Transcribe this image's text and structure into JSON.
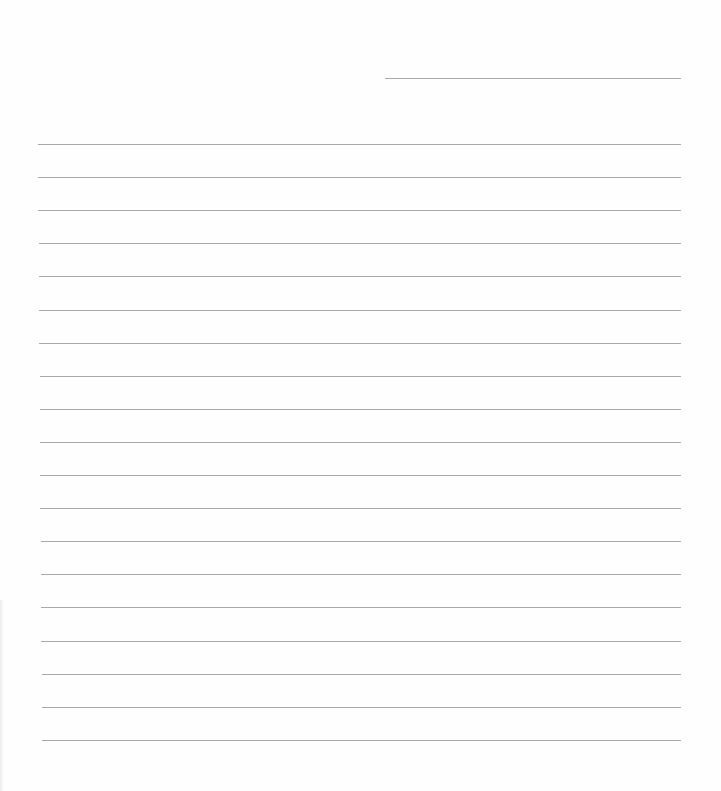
{
  "document": {
    "type": "lined-paper",
    "header_line": {
      "label": "",
      "value": "",
      "x": 385,
      "y": 78,
      "width": 296
    },
    "writing_lines": {
      "count": 19,
      "start_y": 144,
      "spacing": 33.1,
      "left_x": 38,
      "right_x": 681,
      "color": "#a9a9a9",
      "values": [
        "",
        "",
        "",
        "",
        "",
        "",
        "",
        "",
        "",
        "",
        "",
        "",
        "",
        "",
        "",
        "",
        "",
        "",
        ""
      ]
    }
  }
}
